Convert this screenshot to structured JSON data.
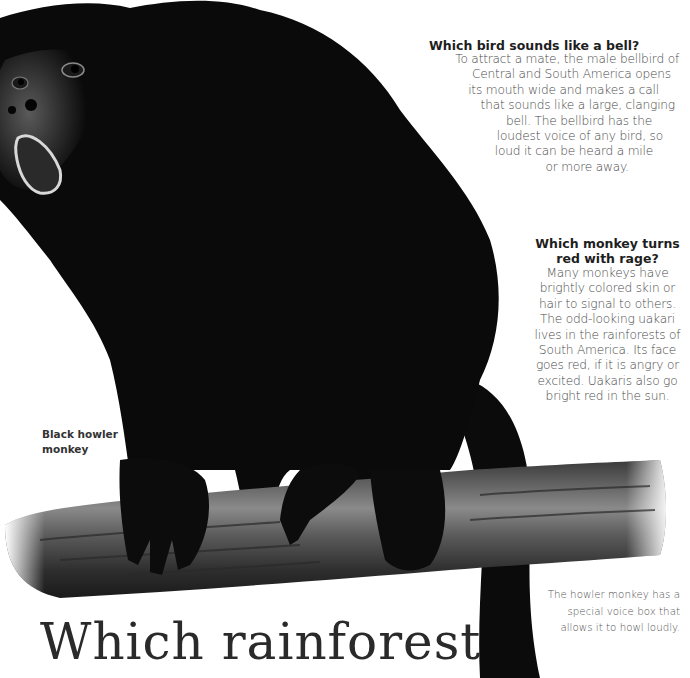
{
  "page": {
    "headline": "Which rainforest",
    "image_caption": {
      "line1": "Black howler",
      "line2": "monkey"
    },
    "side_note": {
      "lines": [
        "The howler monkey has a",
        "special voice box that",
        "allows it to howl loudly."
      ]
    }
  },
  "questions": [
    {
      "title": "Which bird sounds like a bell?",
      "lines": [
        "To attract a mate, the male bellbird of",
        "Central and South America opens",
        "its mouth wide and makes a call",
        "that sounds like a large, clanging",
        "bell. The bellbird has the",
        "loudest voice of any bird, so",
        "loud it can be heard a mile",
        "or more away."
      ]
    },
    {
      "title_lines": [
        "Which monkey turns",
        "red with rage?"
      ],
      "lines": [
        "Many monkeys have",
        "brightly colored skin or",
        "hair to signal to others.",
        "The odd-looking uakari",
        "lives in the rainforests of",
        "South America. Its face",
        "goes red, if it is angry or",
        "excited. Uakaris also go",
        "bright red in the sun."
      ]
    }
  ],
  "illustration": {
    "subject": "black howler monkey on branch",
    "fur_color": "#0a0a0a",
    "branch_color": "#4a4a4a",
    "background": "#ffffff"
  }
}
